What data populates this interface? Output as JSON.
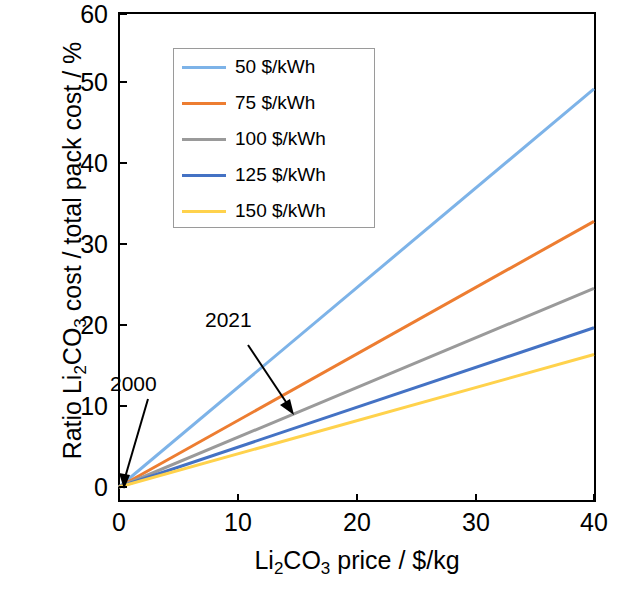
{
  "chart_data": {
    "type": "line",
    "title": "",
    "xlabel": "Li2CO3 price / $/kg",
    "ylabel": "Ratio Li2CO3 cost / total pack cost / %",
    "xlim": [
      0,
      40
    ],
    "ylim": [
      0,
      60
    ],
    "xticks": [
      0,
      10,
      20,
      30,
      40
    ],
    "yticks": [
      0,
      10,
      20,
      30,
      40,
      50,
      60
    ],
    "grid": false,
    "legend_position": "upper-left-inside",
    "x": [
      0,
      40
    ],
    "series": [
      {
        "name": "50 $/kWh",
        "values": [
          0,
          50.5
        ],
        "color": "#7DB3E8"
      },
      {
        "name": "75 $/kWh",
        "values": [
          0,
          33.7
        ],
        "color": "#ED7D31"
      },
      {
        "name": "100 $/kWh",
        "values": [
          0,
          25.2
        ],
        "color": "#9A9A9A"
      },
      {
        "name": "125 $/kWh",
        "values": [
          0,
          20.2
        ],
        "color": "#4472C4"
      },
      {
        "name": "150 $/kWh",
        "values": [
          0,
          16.8
        ],
        "color": "#FFD24C"
      }
    ],
    "annotations": [
      {
        "label": "2000",
        "x": 0.3,
        "y": 0.4
      },
      {
        "label": "2021",
        "x": 14.0,
        "y": 9.0
      }
    ]
  },
  "axis": {
    "xlabel_parts": {
      "pre": "Li",
      "sub1": "2",
      "mid": "CO",
      "sub2": "3",
      "post": " price / $/kg"
    },
    "ylabel_parts": {
      "pre": "Ratio Li",
      "sub1": "2",
      "mid": "CO",
      "sub2": "3",
      "post": " cost / total pack cost / %"
    },
    "xticks": [
      "0",
      "10",
      "20",
      "30",
      "40"
    ],
    "yticks": [
      "0",
      "10",
      "20",
      "30",
      "40",
      "50",
      "60"
    ]
  },
  "legend": {
    "entries": [
      {
        "label": "50 $/kWh",
        "color": "#7DB3E8"
      },
      {
        "label": "75 $/kWh",
        "color": "#ED7D31"
      },
      {
        "label": "100 $/kWh",
        "color": "#9A9A9A"
      },
      {
        "label": "125 $/kWh",
        "color": "#4472C4"
      },
      {
        "label": "150 $/kWh",
        "color": "#FFD24C"
      }
    ]
  },
  "annotations": {
    "a2000": "2000",
    "a2021": "2021"
  }
}
